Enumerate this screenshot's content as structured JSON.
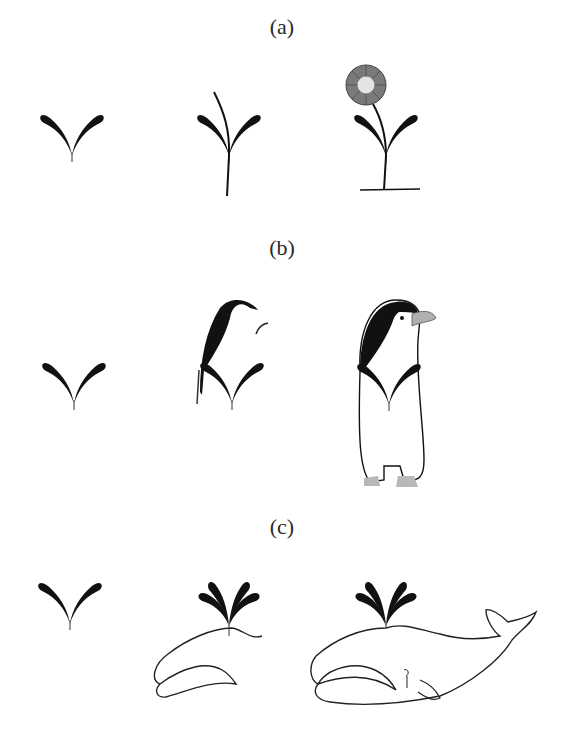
{
  "figure": {
    "panels": [
      {
        "label": "(a)",
        "theme": "plant",
        "stages": [
          "sprout-glyph",
          "sprout-with-stem",
          "flower"
        ]
      },
      {
        "label": "(b)",
        "theme": "penguin",
        "stages": [
          "sprout-glyph",
          "partial-penguin",
          "penguin"
        ]
      },
      {
        "label": "(c)",
        "theme": "whale",
        "stages": [
          "sprout-glyph",
          "partial-whale-spout",
          "whale"
        ]
      }
    ],
    "colors": {
      "ink": "#111111",
      "flower_petals": "#7a7a7a",
      "flower_center": "#e4e4e4",
      "beak": "#b0b0b0",
      "feet": "#b8b8b8",
      "background": "#ffffff"
    }
  }
}
